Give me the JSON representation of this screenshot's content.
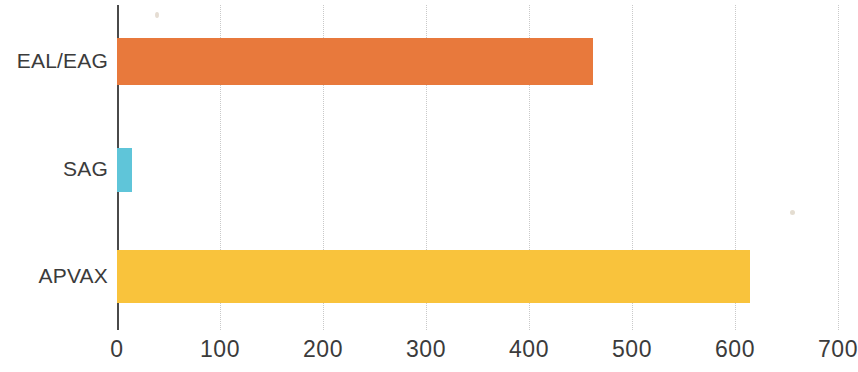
{
  "chart_data": {
    "type": "bar",
    "orientation": "horizontal",
    "title": "",
    "subtitle": "",
    "xlabel": "",
    "ylabel": "",
    "categories": [
      "EAL/EAG",
      "SAG",
      "APVAX"
    ],
    "values": [
      462,
      15,
      615
    ],
    "series": [
      {
        "name": "",
        "values": [
          462,
          15,
          615
        ]
      }
    ],
    "bar_colors": [
      "#E8793C",
      "#5FC5D9",
      "#F9C33C"
    ],
    "xlim": [
      0,
      700
    ],
    "ylim": [
      0,
      3
    ],
    "xticks": [
      0,
      100,
      200,
      300,
      400,
      500,
      600,
      700
    ],
    "xtick_labels": [
      "0",
      "100",
      "200",
      "300",
      "400",
      "500",
      "600",
      "700"
    ],
    "grid": true,
    "grid_axis": "x",
    "grid_style": "dotted",
    "grid_color": "#c9c9c9",
    "axis_line_color": "#4a4a4a",
    "legend": false,
    "legend_position": "none",
    "annotations": [],
    "background_color": "#ffffff",
    "label_color": "#3b3b3b"
  },
  "bars": [
    {
      "category": "EAL/EAG",
      "value": 462,
      "color": "#E8793C"
    },
    {
      "category": "SAG",
      "value": 15,
      "color": "#5FC5D9"
    },
    {
      "category": "APVAX",
      "value": 615,
      "color": "#F9C33C"
    }
  ],
  "axis": {
    "ticks": [
      "0",
      "100",
      "200",
      "300",
      "400",
      "500",
      "600",
      "700"
    ]
  }
}
